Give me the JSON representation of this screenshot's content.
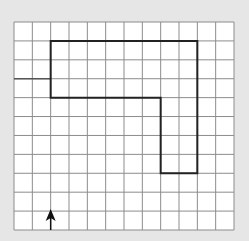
{
  "diagram": {
    "type": "grid-path",
    "background_color": "#e6e6e6",
    "grid": {
      "columns": 12,
      "rows": 11,
      "left": 14,
      "top": 22,
      "right": 234,
      "bottom": 230,
      "line_color": "#8c8c8c",
      "fill_color": "#ffffff"
    },
    "path": {
      "description": "Closed thick outline shaped like an inverted L",
      "stroke_color": "#222222",
      "stroke_width": 2,
      "grid_points": [
        [
          2,
          1
        ],
        [
          10,
          1
        ],
        [
          10,
          8
        ],
        [
          8,
          8
        ],
        [
          8,
          4
        ],
        [
          2,
          4
        ]
      ]
    },
    "entry_line": {
      "description": "Darker grid segment from left edge to the shape",
      "from": [
        0,
        3
      ],
      "to": [
        2,
        3
      ],
      "color": "#555555"
    },
    "arrow": {
      "direction": "up",
      "column_line": 2,
      "from_row": 11,
      "to_row": 10,
      "color": "#111111"
    }
  }
}
